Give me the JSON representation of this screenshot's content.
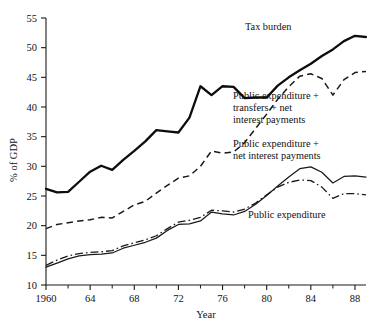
{
  "chart_data": {
    "type": "line",
    "title": "",
    "xlabel": "Year",
    "ylabel": "% of GDP",
    "xlim": [
      1960,
      1989
    ],
    "ylim": [
      10,
      55
    ],
    "grid": false,
    "legend_position": "inline-annotations",
    "x_major_ticks": [
      1960,
      1964,
      1968,
      1972,
      1976,
      1980,
      1984,
      1988
    ],
    "x_major_tick_labels": [
      "1960",
      "64",
      "68",
      "72",
      "76",
      "80",
      "84",
      "88"
    ],
    "x_minor_ticks": [
      1962,
      1966,
      1970,
      1974,
      1978,
      1982,
      1986
    ],
    "y_ticks": [
      10,
      15,
      20,
      25,
      30,
      35,
      40,
      45,
      50,
      55
    ],
    "y_tick_labels": [
      "10",
      "15",
      "20",
      "25",
      "30",
      "35",
      "40",
      "45",
      "50",
      "55"
    ],
    "x": [
      1960,
      1961,
      1962,
      1963,
      1964,
      1965,
      1966,
      1967,
      1968,
      1969,
      1970,
      1971,
      1972,
      1973,
      1974,
      1975,
      1976,
      1977,
      1978,
      1979,
      1980,
      1981,
      1982,
      1983,
      1984,
      1985,
      1986,
      1987,
      1988,
      1989
    ],
    "series": [
      {
        "name": "Tax burden",
        "style": "thick-solid",
        "values": [
          26.2,
          25.6,
          25.7,
          27.4,
          29.1,
          30.1,
          29.4,
          31.1,
          32.6,
          34.2,
          36.1,
          35.9,
          35.7,
          38.2,
          43.5,
          42.0,
          43.5,
          43.4,
          41.5,
          41.6,
          41.6,
          43.6,
          45.0,
          46.2,
          47.3,
          48.6,
          49.7,
          51.1,
          52.0,
          51.8
        ]
      },
      {
        "name": "Public expenditure + transfers + net interest payments",
        "style": "dashed",
        "values": [
          19.5,
          20.2,
          20.5,
          20.8,
          21.0,
          21.4,
          21.3,
          22.4,
          23.5,
          24.1,
          25.5,
          26.8,
          28.0,
          28.4,
          30.0,
          32.6,
          32.2,
          32.4,
          34.0,
          36.4,
          38.8,
          41.3,
          43.4,
          45.2,
          45.6,
          44.8,
          42.0,
          44.6,
          45.8,
          46.0
        ]
      },
      {
        "name": "Public expenditure + net interest payments",
        "style": "thin-solid",
        "values": [
          13.0,
          13.7,
          14.4,
          14.9,
          15.1,
          15.2,
          15.4,
          16.2,
          16.7,
          17.2,
          17.9,
          19.2,
          20.2,
          20.3,
          20.8,
          22.3,
          22.0,
          21.8,
          22.4,
          23.6,
          25.1,
          26.7,
          28.2,
          29.6,
          29.9,
          29.0,
          27.2,
          28.3,
          28.4,
          28.2
        ]
      },
      {
        "name": "Public expenditure",
        "style": "dash-dot",
        "values": [
          13.3,
          14.2,
          14.9,
          15.3,
          15.5,
          15.6,
          15.8,
          16.6,
          17.1,
          17.6,
          18.3,
          19.5,
          20.6,
          20.9,
          21.4,
          22.6,
          22.5,
          22.3,
          22.8,
          23.8,
          25.2,
          26.5,
          27.3,
          27.7,
          27.6,
          26.5,
          24.6,
          25.4,
          25.4,
          25.2
        ]
      }
    ],
    "annotations": [
      {
        "id": "tax-burden",
        "lines": [
          "Tax burden"
        ],
        "x": 245,
        "y": 30
      },
      {
        "id": "pub-exp-transfers-interest",
        "lines": [
          "Public expenditure +",
          "transfers + net",
          "interest payments"
        ],
        "x": 233,
        "y": 99
      },
      {
        "id": "pub-exp-interest",
        "lines": [
          "Public expenditure +",
          "net interest payments"
        ],
        "x": 233,
        "y": 147
      },
      {
        "id": "pub-exp",
        "lines": [
          "Public expenditure"
        ],
        "x": 248,
        "y": 218
      }
    ]
  }
}
